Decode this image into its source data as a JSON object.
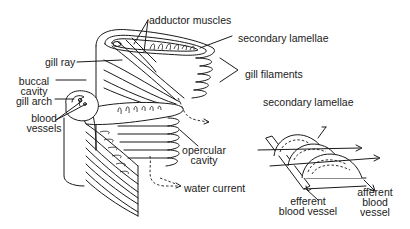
{
  "diagram": {
    "main_figure": {
      "labels": {
        "adductor_muscles": "adductor muscles",
        "secondary_lamellae": "secondary lamellae",
        "gill_ray": "gill ray",
        "gill_filaments": "gill filaments",
        "buccal_cavity_line1": "buccal",
        "buccal_cavity_line2": "cavity",
        "gill_arch": "gill arch",
        "blood_vessels_line1": "blood",
        "blood_vessels_line2": "vessels",
        "opercular_cavity_line1": "opercular",
        "opercular_cavity_line2": "cavity",
        "water_current": "water current"
      }
    },
    "inset_figure": {
      "labels": {
        "secondary_lamellae": "secondary lamellae",
        "efferent_line1": "efferent",
        "efferent_line2": "blood vessel",
        "afferent_line1": "afferent",
        "afferent_line2": "blood",
        "afferent_line3": "vessel"
      }
    },
    "colors": {
      "ink": "#1a1a1a",
      "background": "#ffffff"
    }
  }
}
